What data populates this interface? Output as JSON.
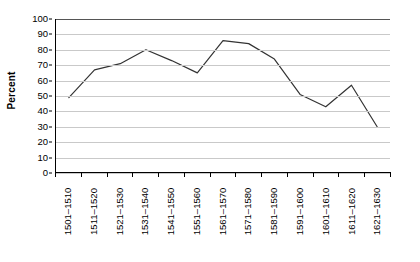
{
  "chart_data": {
    "type": "line",
    "title": "",
    "xlabel": "",
    "ylabel": "Percent",
    "ylim": [
      0,
      100
    ],
    "ytick_step": 10,
    "yticks": [
      100,
      90,
      80,
      70,
      60,
      50,
      40,
      30,
      20,
      10,
      0
    ],
    "grid": true,
    "legend": "none",
    "line_color": "#333333",
    "categories": [
      "1501–1510",
      "1511–1520",
      "1521–1530",
      "1531–1540",
      "1541–1550",
      "1551–1560",
      "1561–1570",
      "1571–1580",
      "1581–1590",
      "1591–1600",
      "1601–1610",
      "1611–1620",
      "1621–1630"
    ],
    "values": [
      49,
      67,
      71,
      80,
      73,
      65,
      86,
      84,
      74,
      51,
      43,
      57,
      30
    ]
  }
}
